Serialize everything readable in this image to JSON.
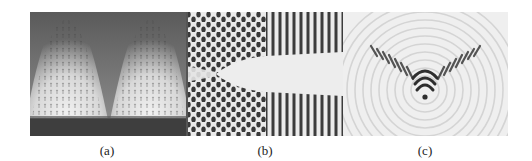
{
  "figure": {
    "panels": [
      {
        "id": "a",
        "label": "(a)",
        "description": "Grayscale field with two bright arch-shaped lobes overlaid by a vector (arrow) field; dark band along the bottom edge"
      },
      {
        "id": "b",
        "label": "(b)",
        "description": "Wave interference pattern: checkerboard lattice in upper and lower regions, a bright wedge-shaped shadow opening to the right, and vertical fringes on the right"
      },
      {
        "id": "c",
        "label": "(c)",
        "description": "Light background with faint concentric circular ripples and a dark V-shaped wake of fringes converging to an apex"
      }
    ],
    "colors": {
      "background": "#ffffff",
      "panel_a_dark": "#4a4a4a",
      "panel_a_light": "#e6e6e6",
      "panel_b_dark": "#3c3c3c",
      "panel_b_light": "#ececec",
      "panel_c_bg": "#efefef",
      "panel_c_fringe": "#2e2e2e"
    }
  }
}
